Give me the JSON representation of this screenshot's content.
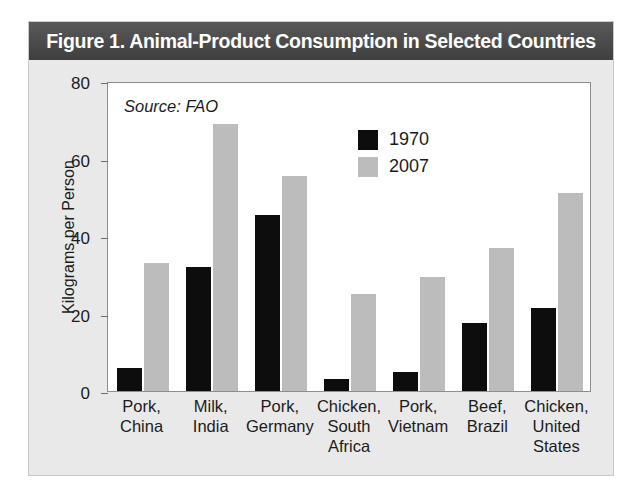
{
  "figure": {
    "title": "Figure 1. Animal-Product Consumption in Selected Countries",
    "source_note": "Source: FAO"
  },
  "colors": {
    "title_band": "#4a4a4a",
    "title_text": "#ffffff",
    "panel_background": "#e9e9e9",
    "plot_background": "#ffffff",
    "series_1970": "#0d0d0d",
    "series_2007": "#bcbcbc",
    "axis": "#6f6f6f",
    "text": "#1c1c1c"
  },
  "chart_data": {
    "type": "bar",
    "title": "Figure 1. Animal-Product Consumption in Selected Countries",
    "subtitle": "Source: FAO",
    "xlabel": "",
    "ylabel": "Kilograms per Person",
    "ylim": [
      0,
      80
    ],
    "yticks": [
      0,
      20,
      40,
      60,
      80
    ],
    "ytick_labels": [
      "0",
      "20",
      "40",
      "60",
      "80"
    ],
    "grid": false,
    "legend_position": "upper center",
    "categories": [
      "Pork, China",
      "Milk, India",
      "Pork, Germany",
      "Chicken, South Africa",
      "Pork, Vietnam",
      "Beef, Brazil",
      "Chicken, United States"
    ],
    "category_lines": [
      [
        "Pork,",
        "China"
      ],
      [
        "Milk,",
        "India"
      ],
      [
        "Pork,",
        "Germany"
      ],
      [
        "Chicken,",
        "South",
        "Africa"
      ],
      [
        "Pork,",
        "Vietnam"
      ],
      [
        "Beef,",
        "Brazil"
      ],
      [
        "Chicken,",
        "United",
        "States"
      ]
    ],
    "series": [
      {
        "name": "1970",
        "color": "#0d0d0d",
        "values": [
          6,
          32,
          45.5,
          3,
          5,
          17.5,
          21.5
        ]
      },
      {
        "name": "2007",
        "color": "#bcbcbc",
        "values": [
          33,
          69,
          55.5,
          25,
          29.5,
          37,
          51
        ]
      }
    ]
  },
  "legend": {
    "entries": [
      {
        "label": "1970",
        "color": "#0d0d0d"
      },
      {
        "label": "2007",
        "color": "#bcbcbc"
      }
    ]
  }
}
